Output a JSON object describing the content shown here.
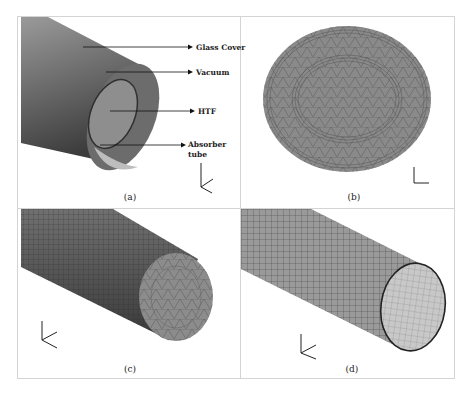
{
  "figure": {
    "panels": [
      {
        "id": "a",
        "caption": "(a)",
        "description": "Geometry of receiver tube",
        "labels": {
          "glass_cover": "Glass Cover",
          "vacuum": "Vacuum",
          "htf": "HTF",
          "absorber_line1": "Absorber",
          "absorber_line2": "tube"
        },
        "axes": {
          "y": "Y",
          "x": "X",
          "z": "Z"
        }
      },
      {
        "id": "b",
        "caption": "(b)",
        "description": "Cross-section triangular mesh",
        "axes": {
          "y": "Y",
          "x": "X"
        }
      },
      {
        "id": "c",
        "caption": "(c)",
        "description": "HTF volume mesh",
        "axes": {
          "y": "Y",
          "x": "X",
          "z": "Z"
        }
      },
      {
        "id": "d",
        "caption": "(d)",
        "description": "Tube surface quad mesh",
        "axes": {
          "y": "Y",
          "x": "X",
          "z": "Z"
        }
      }
    ],
    "colors": {
      "border": "#d4d4d4",
      "mesh_fill": "#8a8a8a",
      "mesh_line": "#555555",
      "dark": "#3a3a3a"
    }
  }
}
